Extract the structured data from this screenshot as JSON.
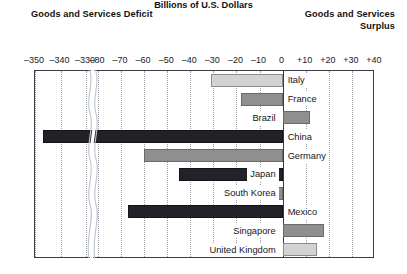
{
  "headings": {
    "deficit": "Goods and Services Deficit",
    "surplus": "Goods and Services Surplus",
    "units": "Billions of U.S. Dollars"
  },
  "chart_data": {
    "type": "bar",
    "orientation": "horizontal",
    "title": "Billions of U.S. Dollars",
    "subtitle_left": "Goods and Services Deficit",
    "subtitle_right": "Goods and Services Surplus",
    "xlabel": "Billions of U.S. Dollars",
    "ylabel": "",
    "grid": true,
    "legend": "none",
    "axis_break": {
      "present": true,
      "between": [
        -330,
        -80
      ],
      "style": "wavy"
    },
    "xlim": [
      -350,
      40
    ],
    "tick_labels": [
      "–350",
      "–340",
      "–330",
      "–80",
      "–70",
      "–60",
      "–50",
      "–40",
      "–30",
      "–20",
      "–10",
      "0",
      "+10",
      "+20",
      "+30",
      "+40"
    ],
    "tick_values": [
      -350,
      -340,
      -330,
      -80,
      -70,
      -60,
      -50,
      -40,
      -30,
      -20,
      -10,
      0,
      10,
      20,
      30,
      40
    ],
    "categories": [
      "Italy",
      "France",
      "Brazil",
      "China",
      "Germany",
      "Japan",
      "South Korea",
      "Mexico",
      "Singapore",
      "United Kingdom"
    ],
    "values": [
      -31,
      -18,
      12,
      -347,
      -60,
      -45,
      -18,
      -67,
      18,
      15
    ],
    "bars": [
      {
        "label": "Italy",
        "value": -31,
        "shade": "light",
        "label_side": "right"
      },
      {
        "label": "France",
        "value": -18,
        "shade": "medium",
        "label_side": "right"
      },
      {
        "label": "Brazil",
        "value": 12,
        "shade": "medium",
        "label_side": "left"
      },
      {
        "label": "China",
        "value": -347,
        "shade": "dark",
        "label_side": "right"
      },
      {
        "label": "Germany",
        "value": -60,
        "shade": "medium",
        "label_side": "right"
      },
      {
        "label": "Japan",
        "value": -45,
        "shade": "dark",
        "label_side": "left"
      },
      {
        "label": "South Korea",
        "value": -18,
        "shade": "medium",
        "label_side": "left"
      },
      {
        "label": "Mexico",
        "value": -67,
        "shade": "dark",
        "label_side": "right"
      },
      {
        "label": "Singapore",
        "value": 18,
        "shade": "medium",
        "label_side": "left"
      },
      {
        "label": "United Kingdom",
        "value": 15,
        "shade": "light",
        "label_side": "left"
      }
    ],
    "colors": {
      "light": "#d2d2d2",
      "medium": "#8f8f8f",
      "dark": "#222228",
      "frame": "#3a3a46",
      "grid": "#9aa0a8",
      "background": "#ffffff"
    }
  }
}
